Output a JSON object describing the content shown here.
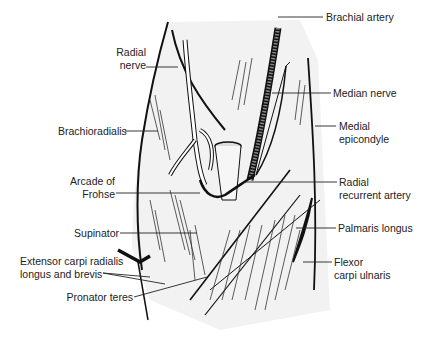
{
  "figure": {
    "colors": {
      "line": "#111111",
      "fill": "#f2f2f2",
      "text": "#222222",
      "background": "#ffffff"
    }
  },
  "labels": {
    "left": [
      {
        "id": "radial-nerve",
        "text": "Radial\nnerve"
      },
      {
        "id": "brachioradialis",
        "text": "Brachioradialis"
      },
      {
        "id": "arcade-of-frohse",
        "text": "Arcade of\nFrohse"
      },
      {
        "id": "supinator",
        "text": "Supinator"
      },
      {
        "id": "extensor-carpi-radialis",
        "text": "Extensor carpi radialis\nlongus and brevis"
      },
      {
        "id": "pronator-teres",
        "text": "Pronator teres"
      }
    ],
    "right": [
      {
        "id": "brachial-artery",
        "text": "Brachial artery"
      },
      {
        "id": "median-nerve",
        "text": "Median nerve"
      },
      {
        "id": "medial-epicondyle",
        "text": "Medial\nepicondyle"
      },
      {
        "id": "radial-recurrent-artery",
        "text": "Radial\nrecurrent artery"
      },
      {
        "id": "palmaris-longus",
        "text": "Palmaris longus"
      },
      {
        "id": "flexor-carpi-ulnaris",
        "text": "Flexor\ncarpi ulnaris"
      }
    ]
  }
}
